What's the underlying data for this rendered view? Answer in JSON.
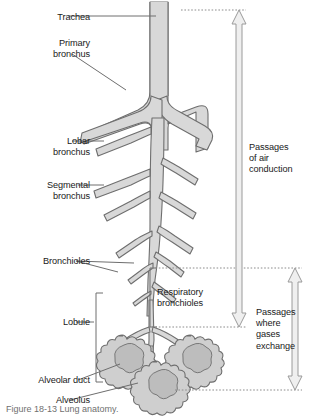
{
  "figure": {
    "caption": "Figure 18-13 Lung anatomy."
  },
  "colors": {
    "airway_fill": "#d8d8d8",
    "airway_stroke": "#6e6e6e",
    "leader_line": "#6e6e6e",
    "dotted_guide": "#8c8c8c",
    "arrow_fill": "#efefef",
    "arrow_stroke": "#9a9a9a",
    "bracket": "#6e6e6e",
    "text": "#1a1a1a",
    "background": "#ffffff"
  },
  "left_labels": [
    {
      "id": "trachea",
      "text": "Trachea",
      "x": 28,
      "y": 12,
      "align": "right",
      "width": 62
    },
    {
      "id": "primary-bronchus",
      "text": "Primary\nbronchus",
      "x": 18,
      "y": 38,
      "align": "right",
      "width": 72
    },
    {
      "id": "lobar-bronchus",
      "text": "Lobar\nbronchus",
      "x": 18,
      "y": 136,
      "align": "right",
      "width": 72
    },
    {
      "id": "segmental-bronchus",
      "text": "Segmental\nbronchus",
      "x": 8,
      "y": 180,
      "align": "right",
      "width": 82
    },
    {
      "id": "bronchioles",
      "text": "Bronchioles",
      "x": 8,
      "y": 256,
      "align": "right",
      "width": 82
    },
    {
      "id": "lobule",
      "text": "Lobule",
      "x": 22,
      "y": 318,
      "align": "right",
      "width": 68
    },
    {
      "id": "alveolar-duct",
      "text": "Alveolar duct",
      "x": 2,
      "y": 376,
      "align": "right",
      "width": 88
    },
    {
      "id": "alveolus",
      "text": "Alveolus",
      "x": 22,
      "y": 396,
      "align": "right",
      "width": 68
    }
  ],
  "right_labels": [
    {
      "id": "passages-air-conduction",
      "text": "Passages\nof air\nconduction",
      "x": 249,
      "y": 142,
      "width": 74
    },
    {
      "id": "respiratory-bronchioles",
      "text": "Respiratory\nbronchioles",
      "x": 157,
      "y": 287,
      "width": 74
    },
    {
      "id": "passages-gases-exchange",
      "text": "Passages\nwhere\ngases\nexchange",
      "x": 273,
      "y": 307,
      "width": 54
    }
  ],
  "arrows": [
    {
      "id": "air-conduction-arrow",
      "x": 239,
      "top": 10,
      "bottom": 327,
      "label_ref": "passages-air-conduction"
    },
    {
      "id": "gas-exchange-arrow",
      "x": 295,
      "top": 268,
      "bottom": 390,
      "label_ref": "passages-gases-exchange"
    }
  ],
  "brackets": [
    {
      "id": "lobule-bracket",
      "x": 97,
      "top": 293,
      "bottom": 382,
      "side": "left"
    },
    {
      "id": "respiratory-bronchioles-bracket",
      "x": 150,
      "top": 268,
      "bottom": 327,
      "side": "left"
    }
  ],
  "guide_lines": [
    {
      "id": "guide-top",
      "y": 10,
      "x1": 181,
      "x2": 246
    },
    {
      "id": "guide-resp-top",
      "y": 268,
      "x1": 152,
      "x2": 302
    },
    {
      "id": "guide-resp-bottom",
      "y": 327,
      "x1": 152,
      "x2": 246
    },
    {
      "id": "guide-alveolar-bottom",
      "y": 390,
      "x1": 175,
      "x2": 302
    }
  ],
  "tree": {
    "description": "Branching bronchial tree from trachea to alveolar sacs",
    "parts": [
      "trachea",
      "primary-bronchi",
      "lobar-bronchi",
      "segmental-bronchi",
      "bronchioles",
      "respiratory-bronchioles",
      "alveolar-ducts",
      "alveolar-sacs"
    ]
  }
}
